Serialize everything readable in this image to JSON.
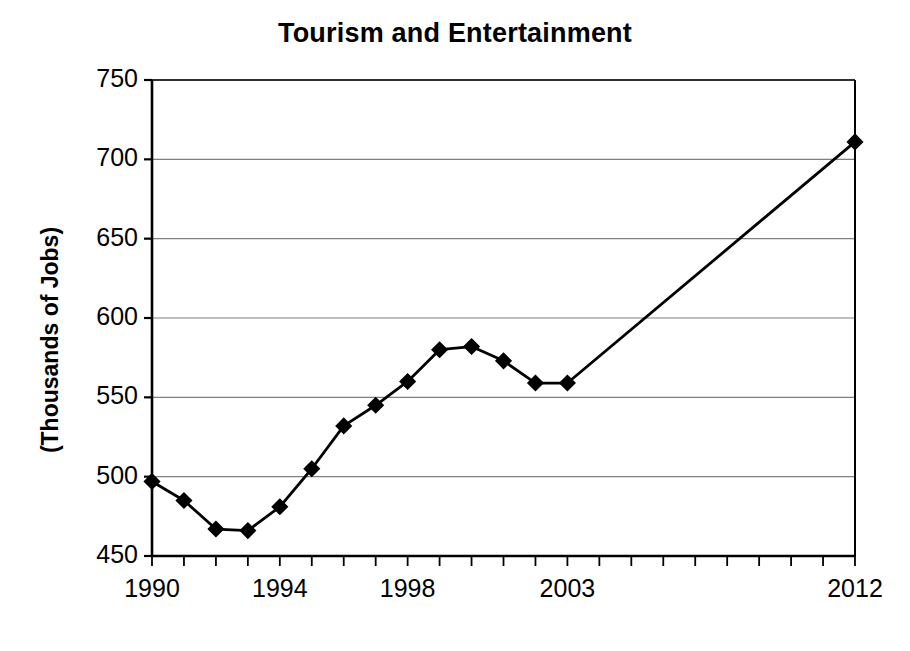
{
  "chart_data": {
    "type": "line",
    "title": "Tourism and Entertainment",
    "xlabel": "",
    "ylabel": "(Thousands of Jobs)",
    "ylim": [
      450,
      750
    ],
    "xlim": [
      1990,
      2012
    ],
    "grid": true,
    "legend": null,
    "marker": "diamond",
    "line_color": "#000000",
    "marker_color": "#000000",
    "grid_color": "#808080",
    "axis_color": "#000000",
    "background": "#ffffff",
    "y_ticks": [
      450,
      500,
      550,
      600,
      650,
      700,
      750
    ],
    "y_tick_labels": [
      "450",
      "500",
      "550",
      "600",
      "650",
      "700",
      "750"
    ],
    "x_ticks": [
      1990,
      1991,
      1992,
      1993,
      1994,
      1995,
      1996,
      1997,
      1998,
      1999,
      2000,
      2001,
      2002,
      2003,
      2004,
      2005,
      2006,
      2007,
      2008,
      2009,
      2010,
      2011,
      2012
    ],
    "x_tick_labels_shown": [
      "1990",
      "1994",
      "1998",
      "2003",
      "2012"
    ],
    "x_tick_labels_shown_values": [
      1990,
      1994,
      1998,
      2003,
      2012
    ],
    "x": [
      1990,
      1991,
      1992,
      1993,
      1994,
      1995,
      1996,
      1997,
      1998,
      1999,
      2000,
      2001,
      2002,
      2003,
      2012
    ],
    "values": [
      497,
      485,
      467,
      466,
      481,
      505,
      532,
      545,
      560,
      580,
      582,
      573,
      559,
      559,
      711
    ],
    "series": [
      {
        "name": "Tourism and Entertainment",
        "values": [
          497,
          485,
          467,
          466,
          481,
          505,
          532,
          545,
          560,
          580,
          582,
          573,
          559,
          559,
          711
        ]
      }
    ]
  },
  "figure": {
    "title": "Tourism and Entertainment",
    "y_axis_title": "(Thousands of Jobs)"
  }
}
